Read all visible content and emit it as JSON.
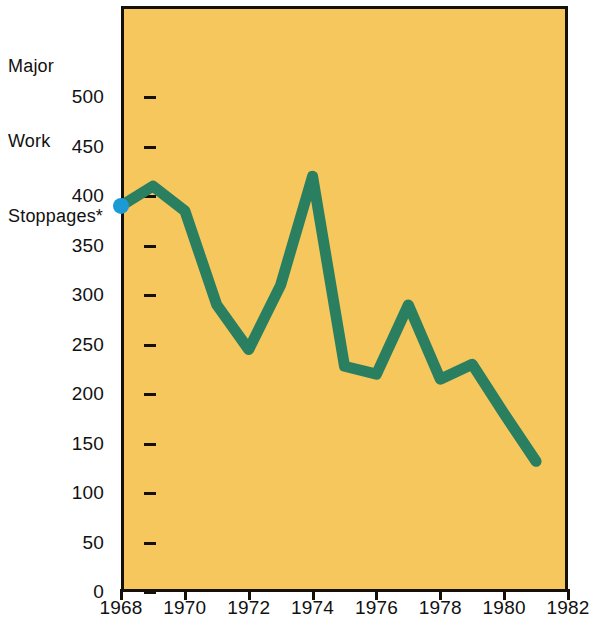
{
  "chart_data": {
    "type": "line",
    "title": "Major Work Stoppages*",
    "title_lines": [
      "Major",
      "Work",
      "Stoppages*"
    ],
    "xlabel": "",
    "ylabel": "",
    "x": [
      1968,
      1969,
      1970,
      1971,
      1972,
      1973,
      1974,
      1975,
      1976,
      1977,
      1978,
      1979,
      1980,
      1981
    ],
    "values": [
      390,
      410,
      385,
      290,
      245,
      310,
      420,
      228,
      220,
      290,
      215,
      230,
      180,
      132
    ],
    "series": [
      {
        "name": "Major Work Stoppages",
        "values": [
          390,
          410,
          385,
          290,
          245,
          310,
          420,
          228,
          220,
          290,
          215,
          230,
          180,
          132
        ]
      }
    ],
    "xlim": [
      1968,
      1982
    ],
    "ylim": [
      0,
      500
    ],
    "x_ticks": [
      "1968",
      "1970",
      "1972",
      "1974",
      "1976",
      "1978",
      "1980",
      "1982"
    ],
    "x_tick_values": [
      1968,
      1970,
      1972,
      1974,
      1976,
      1978,
      1980,
      1982
    ],
    "y_ticks": [
      "0",
      "50",
      "100",
      "150",
      "200",
      "250",
      "300",
      "350",
      "400",
      "450",
      "500"
    ],
    "y_tick_values": [
      0,
      50,
      100,
      150,
      200,
      250,
      300,
      350,
      400,
      450,
      500
    ],
    "grid": false,
    "legend": "none",
    "marker_year": 1968,
    "marker_value": 390
  },
  "colors": {
    "plot_background": "#F6C75D",
    "line": "#2A7F60",
    "marker": "#1C9AD6",
    "axis": "#151008",
    "text": "#111111",
    "page_background": "#FFFFFF"
  }
}
